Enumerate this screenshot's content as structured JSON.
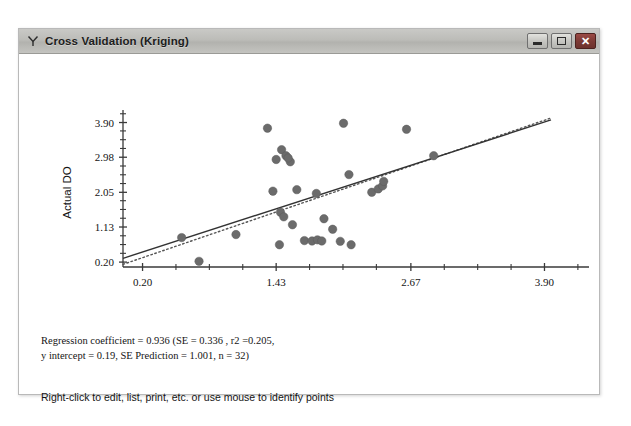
{
  "window": {
    "title": "Cross Validation (Kriging)",
    "icon": "y-shaped-icon",
    "controls": {
      "minimize_label": "–",
      "maximize_label": "□",
      "close_label": "✕"
    }
  },
  "footer": {
    "stats_line_1": "Regression coefficient = 0.936 (SE = 0.336 , r2 =0.205,",
    "stats_line_2": "y intercept = 0.19, SE Prediction = 1.001, n = 32)",
    "hint": "Right-click to edit, list, print, etc. or use mouse to identify points"
  },
  "colors": {
    "point": "#6b6b6b",
    "axis": "#3a3a3a",
    "fit_line": "#333333",
    "reference_line": "#555555",
    "title_bar": "#bcbcb8",
    "close_button": "#7d3a35"
  },
  "chart_data": {
    "type": "scatter",
    "title": "",
    "xlabel": "Estimated DO",
    "ylabel": "Actual DO",
    "xlim": [
      0.02,
      3.96
    ],
    "ylim": [
      0.07,
      4.02
    ],
    "xticks": [
      0.2,
      1.43,
      2.67,
      3.9
    ],
    "xtick_labels": [
      "0.20",
      "1.43",
      "2.67",
      "3.90"
    ],
    "yticks": [
      0.2,
      1.13,
      2.05,
      2.98,
      3.9
    ],
    "ytick_labels": [
      "0.20",
      "1.13",
      "2.05",
      "2.98",
      "3.90"
    ],
    "minor_ticks_per_interval": 3,
    "grid": false,
    "legend": false,
    "points": [
      {
        "x": 0.72,
        "y": 0.22
      },
      {
        "x": 0.56,
        "y": 0.85
      },
      {
        "x": 1.06,
        "y": 0.93
      },
      {
        "x": 1.35,
        "y": 3.75
      },
      {
        "x": 1.48,
        "y": 3.18
      },
      {
        "x": 1.52,
        "y": 3.02
      },
      {
        "x": 1.56,
        "y": 2.86
      },
      {
        "x": 1.4,
        "y": 2.08
      },
      {
        "x": 1.47,
        "y": 1.52
      },
      {
        "x": 1.5,
        "y": 1.4
      },
      {
        "x": 1.46,
        "y": 0.66
      },
      {
        "x": 1.58,
        "y": 1.19
      },
      {
        "x": 1.62,
        "y": 2.12
      },
      {
        "x": 1.69,
        "y": 0.77
      },
      {
        "x": 1.76,
        "y": 0.76
      },
      {
        "x": 1.81,
        "y": 0.79
      },
      {
        "x": 1.85,
        "y": 0.76
      },
      {
        "x": 1.8,
        "y": 2.02
      },
      {
        "x": 1.87,
        "y": 1.35
      },
      {
        "x": 1.95,
        "y": 1.07
      },
      {
        "x": 2.02,
        "y": 0.75
      },
      {
        "x": 2.05,
        "y": 3.88
      },
      {
        "x": 2.1,
        "y": 2.52
      },
      {
        "x": 2.12,
        "y": 0.66
      },
      {
        "x": 2.31,
        "y": 2.05
      },
      {
        "x": 2.37,
        "y": 2.14
      },
      {
        "x": 2.41,
        "y": 2.22
      },
      {
        "x": 2.42,
        "y": 2.34
      },
      {
        "x": 2.63,
        "y": 3.72
      },
      {
        "x": 2.88,
        "y": 3.02
      },
      {
        "x": 1.43,
        "y": 2.92
      },
      {
        "x": 1.54,
        "y": 2.96
      }
    ],
    "fit_line": {
      "name": "regression line",
      "style": "solid",
      "x0": 0.02,
      "y0": 0.3,
      "x1": 3.96,
      "y1": 3.97
    },
    "reference_line": {
      "name": "1:1 reference line",
      "style": "dotted",
      "x0": 0.02,
      "y0": 0.14,
      "x1": 3.96,
      "y1": 4.02
    },
    "annotations": [
      "Regression coefficient = 0.936 (SE = 0.336 , r2 =0.205,",
      "y intercept = 0.19, SE Prediction = 1.001, n = 32)"
    ]
  }
}
